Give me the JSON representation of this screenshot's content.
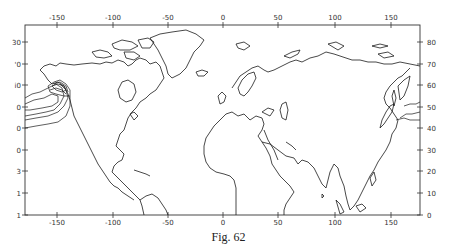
{
  "caption": "Fig. 62",
  "map": {
    "frame": {
      "left": 25,
      "right": 420,
      "top": 25,
      "bottom": 215
    },
    "x_ticks": [
      {
        "label": "-150",
        "x": 57
      },
      {
        "label": "-100",
        "x": 113
      },
      {
        "label": "-50",
        "x": 168
      },
      {
        "label": "0",
        "x": 223
      },
      {
        "label": "50",
        "x": 278
      },
      {
        "label": "100",
        "x": 335
      },
      {
        "label": "150",
        "x": 391
      }
    ],
    "y_ticks_right": [
      {
        "label": "80",
        "y": 42
      },
      {
        "label": "70",
        "y": 64
      },
      {
        "label": "60",
        "y": 85
      },
      {
        "label": "50",
        "y": 107
      },
      {
        "label": "40",
        "y": 128
      },
      {
        "label": "30",
        "y": 150
      },
      {
        "label": "20",
        "y": 171
      },
      {
        "label": "10",
        "y": 193
      },
      {
        "label": "0",
        "y": 215
      }
    ],
    "y_ticks_left_visible": [
      {
        "label": "30",
        "y": 42
      },
      {
        "label": "'0",
        "y": 64
      },
      {
        "label": "i0",
        "y": 85
      },
      {
        "label": "0",
        "y": 107
      },
      {
        "label": "0",
        "y": 128
      },
      {
        "label": "0",
        "y": 150
      },
      {
        "label": "3",
        "y": 171
      },
      {
        "label": "1",
        "y": 193
      },
      {
        "label": "1",
        "y": 215
      }
    ],
    "content": "World coastline map with contour lines over the Gulf of Alaska / NE Pacific and NW Pacific off Japan",
    "line_color": "#1a1a1a"
  }
}
